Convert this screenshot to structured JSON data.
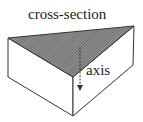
{
  "diagram": {
    "title": "cross-section",
    "axis_label": "axis",
    "colors": {
      "stroke": "#333333",
      "hatch": "#555555",
      "background": "#ffffff"
    },
    "shape": "triangular-prism",
    "vertices": {
      "top_left": [
        8,
        38
      ],
      "top_right": [
        134,
        26
      ],
      "top_front": [
        73,
        77
      ],
      "bottom_left": [
        8,
        77
      ],
      "bottom_right": [
        133,
        65
      ],
      "bottom_front": [
        73,
        116
      ]
    }
  }
}
